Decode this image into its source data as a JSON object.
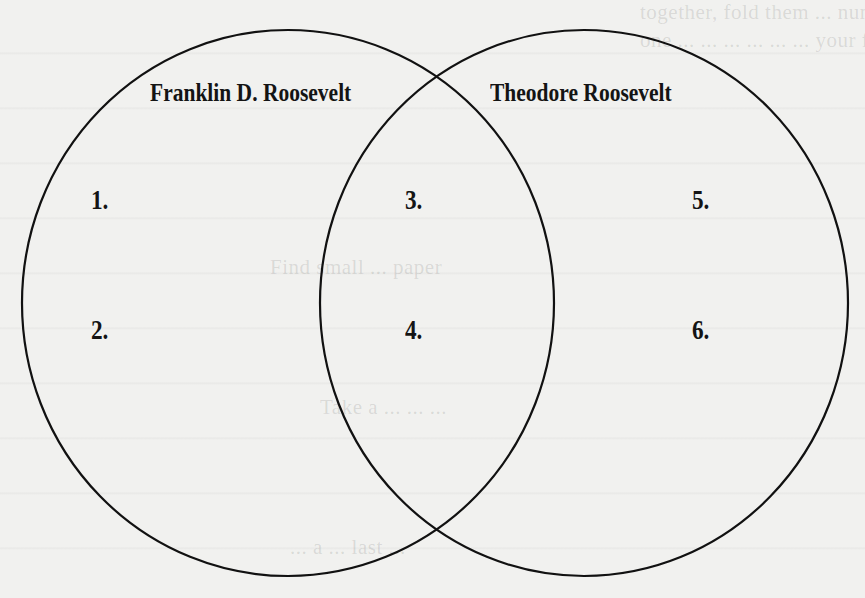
{
  "diagram": {
    "type": "venn",
    "circles": [
      {
        "id": "left",
        "title": "Franklin D. Roosevelt",
        "cx": 288,
        "cy": 303,
        "r": 266
      },
      {
        "id": "right",
        "title": "Theodore Roosevelt",
        "cx": 584,
        "cy": 303,
        "r": 264
      }
    ],
    "slots": [
      {
        "label": "1.",
        "region": "Franklin D. Roosevelt only"
      },
      {
        "label": "2.",
        "region": "Franklin D. Roosevelt only"
      },
      {
        "label": "3.",
        "region": "both"
      },
      {
        "label": "4.",
        "region": "both"
      },
      {
        "label": "5.",
        "region": "Theodore Roosevelt only"
      },
      {
        "label": "6.",
        "region": "Theodore Roosevelt only"
      }
    ],
    "stroke_color": "#111111",
    "background_color": "#f1f1ef"
  },
  "bleed_through": {
    "line1": "together, fold them ... number ... of the pages of the",
    "line2": "one ... ... ... ... ... ... your figure",
    "line3": "Find small ... paper",
    "line4": "Take a ... ... ...",
    "line5": "... a ... last ..."
  }
}
